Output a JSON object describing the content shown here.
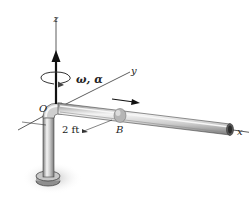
{
  "diagram": {
    "axes": {
      "z_label": "z",
      "y_label": "y",
      "x_label": "x"
    },
    "points": {
      "origin_label": "O",
      "point_b_label": "B"
    },
    "rotation_label": "ω, α",
    "dimension_label": "2 ft",
    "colors": {
      "line": "#222222",
      "pipe_fill": "#d4d4d4",
      "pipe_highlight": "#f2f2f2",
      "pipe_shadow": "#8a8a8a",
      "collar": "#b8b8b8",
      "base": "#9a9a9a",
      "shadow": "#cfcfcf"
    }
  }
}
